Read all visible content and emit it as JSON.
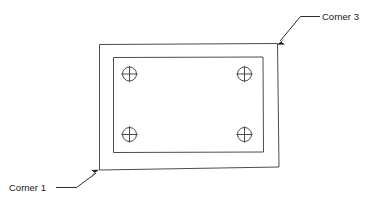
{
  "figure": {
    "name": "corner-callout-diagram",
    "background_color": "#ffffff",
    "line_color": "#4d4d4d",
    "leader_color": "#2b2b2b",
    "text_color": "#1a1a1a"
  },
  "plate": {
    "outer_label": "outer plate outline",
    "inner_label": "inner recess outline"
  },
  "fasteners": [
    {
      "id": "fastener-top-left",
      "label": "screw top left"
    },
    {
      "id": "fastener-top-right",
      "label": "screw top right"
    },
    {
      "id": "fastener-bottom-left",
      "label": "screw bottom left"
    },
    {
      "id": "fastener-bottom-right",
      "label": "screw bottom right"
    }
  ],
  "callouts": [
    {
      "id": "callout-corner-3",
      "text": "Corner 3",
      "target": "top-right corner"
    },
    {
      "id": "callout-corner-1",
      "text": "Corner 1",
      "target": "bottom-left corner"
    }
  ]
}
